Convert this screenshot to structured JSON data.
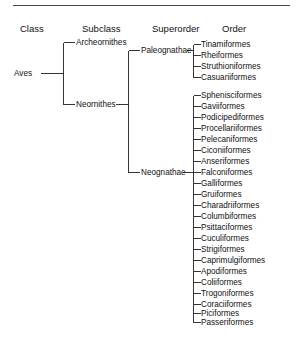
{
  "diagram": {
    "title_rule": true,
    "headers": [
      {
        "label": "Class",
        "x": 20,
        "y": 24
      },
      {
        "label": "Subclass",
        "x": 82,
        "y": 24
      },
      {
        "label": "Superorder",
        "x": 152,
        "y": 24
      },
      {
        "label": "Order",
        "x": 222,
        "y": 24
      }
    ],
    "class_node": {
      "label": "Aves",
      "x": 14,
      "y": 73
    },
    "subclass_nodes": [
      {
        "label": "Archeornithes",
        "x": 76,
        "y": 42
      },
      {
        "label": "Neornithes",
        "x": 76,
        "y": 104
      }
    ],
    "superorder_nodes": [
      {
        "label": "Paleognathae",
        "x": 141,
        "y": 50
      },
      {
        "label": "Neognathae",
        "x": 141,
        "y": 172
      }
    ],
    "paleognathae_orders": [
      {
        "label": "Tinamiformes",
        "y": 44
      },
      {
        "label": "Rheiformes",
        "y": 55
      },
      {
        "label": "Struthioniformes",
        "y": 66
      },
      {
        "label": "Casuariiformes",
        "y": 77
      }
    ],
    "neognathae_orders": [
      {
        "label": "Sphenisciformes",
        "y": 95
      },
      {
        "label": "Gaviiformes",
        "y": 106
      },
      {
        "label": "Podicipediformes",
        "y": 117
      },
      {
        "label": "Procellariiformes",
        "y": 128
      },
      {
        "label": "Pelecaniformes",
        "y": 139
      },
      {
        "label": "Ciconiiformes",
        "y": 150
      },
      {
        "label": "Anseriformes",
        "y": 161
      },
      {
        "label": "Falconiformes",
        "y": 172
      },
      {
        "label": "Galliformes",
        "y": 183
      },
      {
        "label": "Gruiformes",
        "y": 194
      },
      {
        "label": "Charadriiformes",
        "y": 205
      },
      {
        "label": "Columbiformes",
        "y": 216
      },
      {
        "label": "Psittaciformes",
        "y": 227
      },
      {
        "label": "Cuculiformes",
        "y": 238
      },
      {
        "label": "Strigiformes",
        "y": 249
      },
      {
        "label": "Caprimulgiformes",
        "y": 260
      },
      {
        "label": "Apodiformes",
        "y": 271
      },
      {
        "label": "Coliiformes",
        "y": 282
      },
      {
        "label": "Trogoniformes",
        "y": 293
      },
      {
        "label": "Coraciiformes",
        "y": 304
      },
      {
        "label": "Piciformes",
        "y": 313
      },
      {
        "label": "Passeriformes",
        "y": 322
      }
    ],
    "geometry": {
      "rule": {
        "x": 13,
        "y": 5,
        "w": 277,
        "h": 1
      },
      "class_stem_x1": 40,
      "class_stem_x2": 63,
      "subclass_bracket_x": 63,
      "subclass_top_y": 42,
      "subclass_bottom_y": 104,
      "subclass_tick_x2": 74,
      "neornithes_stem_x1": 115,
      "neornithes_stem_x2": 128,
      "superorder_bracket_x": 128,
      "superorder_top_y": 50,
      "superorder_bottom_y": 172,
      "superorder_tick_x2": 139,
      "order_trunk_x": 193,
      "order_tick_x2": 200,
      "paleo_stem_x1": 186,
      "paleo_stem_x2": 193,
      "neo_stem_x1": 182,
      "neo_stem_x2": 193
    },
    "colors": {
      "line": "#1f1f1f",
      "rule": "#4a4a4a",
      "text": "#111111",
      "background": "#ffffff"
    }
  }
}
